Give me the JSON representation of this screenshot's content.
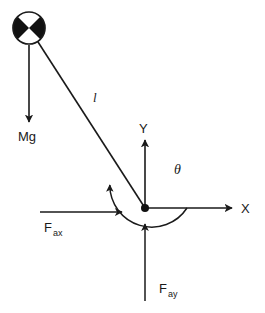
{
  "diagram": {
    "geometry": {
      "width": 265,
      "height": 313,
      "origin_x": 145,
      "origin_y": 208,
      "bob_center_x": 29,
      "bob_center_y": 28,
      "bob_radius": 16,
      "string_label_x": 93,
      "string_label_y": 102,
      "mg_arrow_x": 29,
      "mg_arrow_top_y": 45,
      "mg_arrow_bottom_y": 122,
      "mg_label_x": 18,
      "mg_label_y": 141,
      "x_axis_end_x": 232,
      "x_axis_label_x": 241,
      "x_axis_label_y": 213,
      "y_axis_end_y": 140,
      "y_axis_label_x": 139,
      "y_axis_label_y": 133,
      "theta_arc_radius": 42,
      "theta_arc_start_deg": 0,
      "theta_arc_end_deg": 147,
      "theta_label_x": 174,
      "theta_label_y": 174,
      "fax_arrow_start_x": 40,
      "fax_arrow_end_x": 122,
      "fax_arrow_y": 212,
      "fax_label_x": 44,
      "fax_label_y": 232,
      "fay_arrow_x": 145,
      "fay_arrow_start_y": 301,
      "fay_arrow_end_y": 224,
      "fay_label_x": 159,
      "fay_label_y": 293
    },
    "colors": {
      "stroke": "#1a1a1a",
      "fill_black": "#111111",
      "fill_white": "#ffffff",
      "background": "#ffffff"
    },
    "labels": {
      "string_length": "l",
      "weight": "Mg",
      "x_axis": "X",
      "y_axis": "Y",
      "angle": "θ",
      "force_ax_base": "F",
      "force_ax_sub": "ax",
      "force_ay_base": "F",
      "force_ay_sub": "ay"
    },
    "elements": {
      "bob_name": "pendulum-bob",
      "string_name": "pendulum-string",
      "origin_name": "origin-point"
    }
  }
}
